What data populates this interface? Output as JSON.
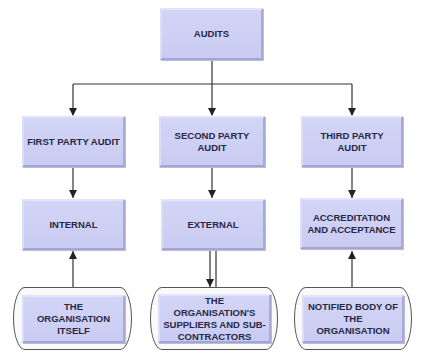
{
  "diagram": {
    "root": {
      "label": "AUDITS"
    },
    "types": [
      {
        "label": "FIRST PARTY AUDIT"
      },
      {
        "label": "SECOND PARTY AUDIT"
      },
      {
        "label": "THIRD PARTY AUDIT"
      }
    ],
    "nature": [
      {
        "label": "INTERNAL"
      },
      {
        "label": "EXTERNAL"
      },
      {
        "label": "ACCREDITATION AND ACCEPTANCE"
      }
    ],
    "auditees": [
      {
        "label": "THE ORGANISATION ITSELF"
      },
      {
        "label": "THE ORGANISATION'S SUPPLIERS AND SUB-CONTRACTORS"
      },
      {
        "label": "NOTIFIED BODY OF THE ORGANISATION"
      }
    ],
    "colors": {
      "box_fill": "#cbcdf3",
      "text": "#262845",
      "line": "#333333"
    }
  }
}
